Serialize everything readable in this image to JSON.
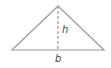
{
  "diagram": {
    "type": "triangle",
    "labels": {
      "height": "h",
      "base": "b"
    },
    "colors": {
      "edge": "#9a9a9a",
      "height_line": "#9a9a9a",
      "text": "#444444"
    },
    "points": {
      "apex": [
        58,
        6
      ],
      "base_left": [
        12,
        50
      ],
      "base_right": [
        104,
        50
      ]
    }
  }
}
